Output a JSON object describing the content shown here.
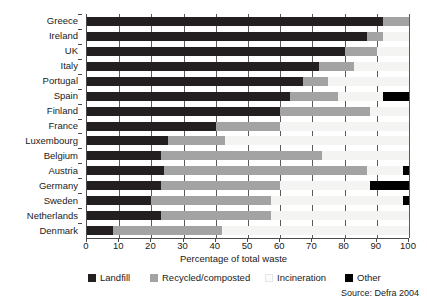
{
  "chart_data": {
    "type": "bar",
    "orientation": "horizontal",
    "stacked": true,
    "title": "",
    "xlabel": "Percentage of total waste",
    "ylabel": "",
    "xlim": [
      0,
      100
    ],
    "xticks": [
      0,
      10,
      20,
      30,
      40,
      50,
      60,
      70,
      80,
      90,
      100
    ],
    "xticklabels": [
      "0",
      "10",
      "20",
      "30",
      "40",
      "50",
      "60",
      "70",
      "80",
      "90",
      "100"
    ],
    "grid": "vertical",
    "legend_position": "bottom",
    "source": "Source: Defra 2004",
    "categories": [
      "Greece",
      "Ireland",
      "UK",
      "Italy",
      "Portugal",
      "Spain",
      "Finland",
      "France",
      "Luxembourg",
      "Belgium",
      "Austria",
      "Germany",
      "Sweden",
      "Netherlands",
      "Denmark"
    ],
    "series": [
      {
        "name": "Landfill",
        "color": "#231f20",
        "values": [
          92,
          87,
          80,
          72,
          67,
          63,
          60,
          40,
          25,
          23,
          24,
          23,
          20,
          23,
          8
        ]
      },
      {
        "name": "Recycled/composted",
        "color": "#a3a3a3",
        "values": [
          8,
          5,
          10,
          11,
          8,
          15,
          28,
          20,
          18,
          50,
          63,
          37,
          37,
          34,
          34
        ]
      },
      {
        "name": "Incineration",
        "color": "#f4f4f2",
        "values": [
          0,
          8,
          10,
          17,
          25,
          14,
          12,
          40,
          57,
          27,
          11,
          28,
          41,
          43,
          58
        ]
      },
      {
        "name": "Other",
        "color": "#000000",
        "values": [
          0,
          0,
          0,
          0,
          0,
          8,
          0,
          0,
          0,
          0,
          2,
          12,
          2,
          0,
          0
        ]
      }
    ]
  },
  "legend": {
    "items": [
      {
        "label": "Landfill",
        "key": "landfill"
      },
      {
        "label": "Recycled/composted",
        "key": "recycled"
      },
      {
        "label": "Incineration",
        "key": "incineration"
      },
      {
        "label": "Other",
        "key": "other"
      }
    ]
  }
}
